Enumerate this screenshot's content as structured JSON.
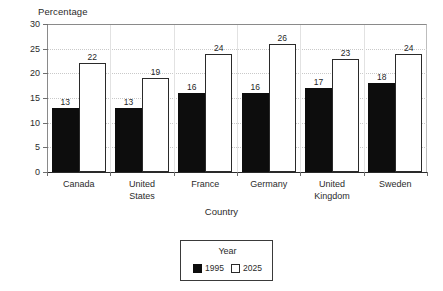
{
  "chart_data": {
    "type": "bar",
    "title": "",
    "xlabel": "Country",
    "ylabel": "Percentage",
    "categories": [
      "Canada",
      "United States",
      "France",
      "Germany",
      "United Kingdom",
      "Sweden"
    ],
    "series": [
      {
        "name": "1995",
        "values": [
          13,
          13,
          16,
          16,
          17,
          18
        ],
        "color": "#0d0d0d"
      },
      {
        "name": "2025",
        "values": [
          22,
          19,
          24,
          26,
          23,
          24
        ],
        "color": "#ffffff"
      }
    ],
    "ylim": [
      0,
      30
    ],
    "yticks": [
      0,
      5,
      10,
      15,
      20,
      25,
      30
    ],
    "ytick_labels": [
      "0",
      "5",
      "10",
      "15",
      "20",
      "25",
      "30"
    ],
    "grid": "horizontal-dotted",
    "legend": {
      "title": "Year",
      "position": "below-plot-center",
      "entries": [
        {
          "label": "1995",
          "swatch": "filled-black"
        },
        {
          "label": "2025",
          "swatch": "outlined-white"
        }
      ]
    },
    "data_labels": "on-top-of-bars"
  }
}
